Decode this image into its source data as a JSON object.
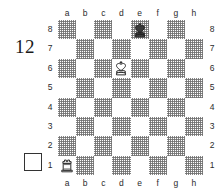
{
  "problem": {
    "number": "12",
    "side_to_move_marker": "white-empty-square"
  },
  "board": {
    "files": [
      "a",
      "b",
      "c",
      "d",
      "e",
      "f",
      "g",
      "h"
    ],
    "ranks": [
      "8",
      "7",
      "6",
      "5",
      "4",
      "3",
      "2",
      "1"
    ],
    "light_square_color": "#ffffff",
    "dark_square_color": "#6e6e6e",
    "border_color": "#2b2b2b",
    "orientation": "white-bottom",
    "pieces": [
      {
        "square": "e8",
        "piece": "king",
        "color": "black",
        "glyph": "♚"
      },
      {
        "square": "d6",
        "piece": "king",
        "color": "white",
        "glyph": "♔"
      },
      {
        "square": "a1",
        "piece": "rook",
        "color": "white",
        "glyph": "♖"
      }
    ]
  }
}
